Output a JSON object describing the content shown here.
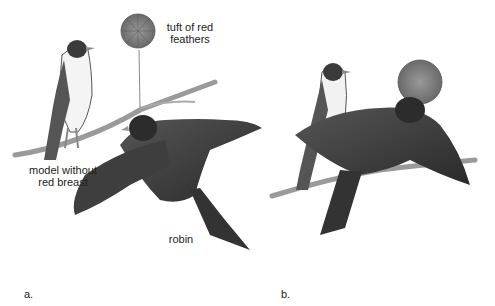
{
  "panels": [
    {
      "id": "a",
      "label": "a."
    },
    {
      "id": "b",
      "label": "b."
    }
  ],
  "annotations": {
    "tuft_line1": "tuft of red",
    "tuft_line2": "feathers",
    "model_line1": "model without",
    "model_line2": "red breast",
    "robin": "robin"
  }
}
